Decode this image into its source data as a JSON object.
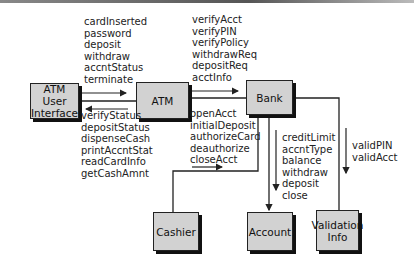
{
  "boxes": {
    "atm_ui": "ATM User Interface",
    "atm_ui_lines": [
      "ATM",
      "User",
      "Interface"
    ],
    "atm": "ATM",
    "bank": "Bank",
    "cashier": "Cashier",
    "account": "Account",
    "validation_lines": [
      "Validation",
      "Info"
    ]
  },
  "messages": {
    "ui_to_atm": [
      "cardInserted",
      "password",
      "deposit",
      "withdraw",
      "accntStatus",
      "terminate"
    ],
    "atm_to_ui": [
      "verifyStatus",
      "depositStatus",
      "dispenseCash",
      "printAccntStat",
      "readCardInfo",
      "getCashAmnt"
    ],
    "atm_to_bank": [
      "verifyAcct",
      "verifyPIN",
      "verifyPolicy",
      "withdrawReq",
      "depositReq",
      "acctInfo"
    ],
    "bank_to_cashier": [
      "openAcct",
      "initialDeposit",
      "authorizeCard",
      "deauthorize",
      "closeAcct"
    ],
    "bank_to_account": [
      "creditLimit",
      "accntType",
      "balance",
      "withdraw",
      "deposit",
      "close"
    ],
    "bank_to_validation": [
      "validPIN",
      "validAcct"
    ]
  },
  "colors": {
    "box_fill": "#d2d2d2",
    "line": "#222222",
    "shadow": "#111111"
  }
}
